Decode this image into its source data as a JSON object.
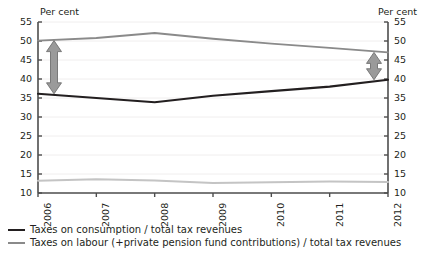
{
  "chart_data": {
    "type": "line",
    "title": "",
    "xlabel": "",
    "ylabel": "Per cent",
    "ylabel_right": "Per cent",
    "ylim": [
      10,
      55
    ],
    "yticks": [
      10,
      15,
      20,
      25,
      30,
      35,
      40,
      45,
      50,
      55
    ],
    "grid": true,
    "legend_position": "bottom-left",
    "categories": [
      "2006",
      "2007",
      "2008",
      "2009",
      "2010",
      "2011",
      "2012"
    ],
    "series": [
      {
        "name": "Taxes on consumption / total tax revenues",
        "color": "#231f20",
        "values": [
          36.1,
          35.0,
          33.9,
          35.6,
          36.8,
          38.0,
          39.8
        ]
      },
      {
        "name": "Taxes on labour (+private pension fund contributions) / total tax revenues",
        "color": "#8a8a8a",
        "values": [
          50.1,
          50.8,
          52.1,
          50.6,
          49.3,
          48.2,
          47.0
        ]
      },
      {
        "name": "",
        "color": "#c4c4c4",
        "values": [
          13.2,
          13.6,
          13.3,
          12.6,
          12.8,
          13.0,
          12.9
        ]
      }
    ],
    "annotations": [
      {
        "name": "gap-arrow-2006",
        "x": "2006",
        "from": 36.1,
        "to": 50.1,
        "style": "double-headed-arrow"
      },
      {
        "name": "gap-arrow-2012",
        "x": "2012",
        "from": 39.8,
        "to": 47.0,
        "style": "double-headed-arrow"
      }
    ]
  },
  "axes": {
    "left_title": "Per cent",
    "right_title": "Per cent",
    "yticks": [
      "55",
      "50",
      "45",
      "40",
      "35",
      "30",
      "25",
      "20",
      "15",
      "10"
    ],
    "xticks": [
      "2006",
      "2007",
      "2008",
      "2009",
      "2010",
      "2011",
      "2012"
    ]
  },
  "legend": {
    "items": [
      {
        "label": "Taxes on consumption / total tax revenues",
        "swatch": "dark"
      },
      {
        "label": "Taxes on labour (+private pension fund contributions) / total tax revenues",
        "swatch": "mid"
      }
    ]
  },
  "colors": {
    "consumption": "#231f20",
    "labour": "#8a8a8a",
    "third": "#c4c4c4",
    "arrow": "#9a9a9a",
    "axis": "#4d4d4d",
    "grid": "#f0eeee"
  }
}
